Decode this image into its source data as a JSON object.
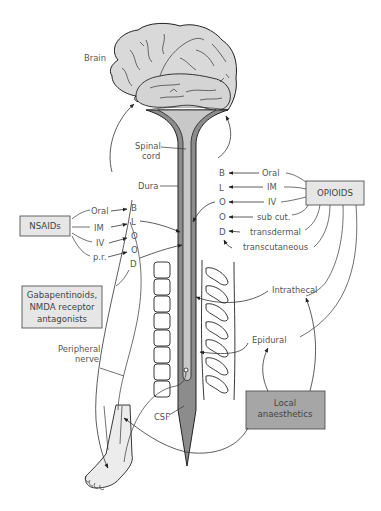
{
  "anatomy_labels": {
    "brain": "Brain",
    "spinal_cord": "Spinal\ncord",
    "spinal_cord_line1": "Spinal",
    "spinal_cord_line2": "cord",
    "dura": "Dura",
    "peripheral_nerve_line1": "Peripheral",
    "peripheral_nerve_line2": "nerve",
    "csf": "CSF"
  },
  "opioids": {
    "box_label": "OPIOIDS",
    "routes": [
      "Oral",
      "IM",
      "IV",
      "sub cut.",
      "transdermal",
      "transcutaneous"
    ],
    "letters": [
      "B",
      "L",
      "O",
      "O",
      "D"
    ],
    "other_routes": [
      "Intrathecal",
      "Epidural"
    ]
  },
  "nsaids": {
    "box_label": "NSAIDs",
    "routes": [
      "Oral",
      "IM",
      "IV",
      "p.r."
    ],
    "letters": [
      "B",
      "L",
      "O",
      "O",
      "D"
    ]
  },
  "gabapentinoids": {
    "line1": "Gabapentinoids,",
    "line2": "NMDA receptor",
    "line3": "antagonists"
  },
  "local_anaesthetics": {
    "line1": "Local",
    "line2": "anaesthetics",
    "routes": [
      "Intrathecal",
      "Epidural"
    ]
  },
  "colors": {
    "brain_fill": "#d9d9d9",
    "dura_fill": "#8c8c8c",
    "cord_fill": "#c8c8c8",
    "box_fill_light": "#e6e6e6",
    "box_fill_dark": "#a6a6a6",
    "text": "#555555"
  }
}
